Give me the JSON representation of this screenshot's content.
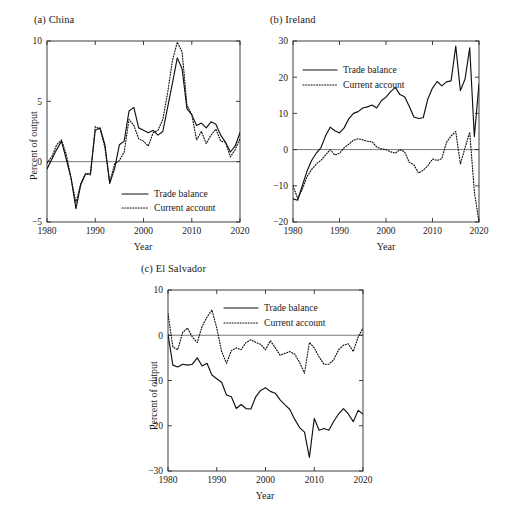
{
  "figure": {
    "panel_count": 3,
    "shared_xlabel": "Year",
    "shared_ylabel": "Percent of output",
    "legend_labels": {
      "solid": "Trade balance",
      "dotted": "Current account"
    },
    "line_color": "#111111"
  },
  "chart_data": [
    {
      "type": "line",
      "title": "(a) China",
      "xlabel": "Year",
      "ylabel": "Percent of output",
      "xlim": [
        1980,
        2020
      ],
      "ylim": [
        -5,
        10
      ],
      "xticks": [
        1980,
        1990,
        2000,
        2010,
        2020
      ],
      "yticks": [
        -5,
        0,
        5,
        10
      ],
      "grid": false,
      "legend_position": "lower-right",
      "x": [
        1980,
        1981,
        1982,
        1983,
        1984,
        1985,
        1986,
        1987,
        1988,
        1989,
        1990,
        1991,
        1992,
        1993,
        1994,
        1995,
        1996,
        1997,
        1998,
        1999,
        2000,
        2001,
        2002,
        2003,
        2004,
        2005,
        2006,
        2007,
        2008,
        2009,
        2010,
        2011,
        2012,
        2013,
        2014,
        2015,
        2016,
        2017,
        2018,
        2019,
        2020
      ],
      "series": [
        {
          "name": "Trade balance",
          "style": "solid",
          "values": [
            -0.6,
            0.2,
            1.0,
            1.7,
            0.2,
            -1.4,
            -3.9,
            -1.9,
            -1.0,
            -1.0,
            2.6,
            2.8,
            1.4,
            -1.8,
            -0.6,
            1.4,
            1.7,
            4.2,
            4.5,
            2.8,
            2.6,
            2.4,
            2.6,
            2.2,
            2.5,
            4.5,
            6.5,
            8.6,
            7.7,
            4.4,
            3.9,
            3.0,
            3.2,
            2.8,
            3.3,
            3.1,
            2.2,
            1.6,
            0.8,
            1.3,
            2.4
          ]
        },
        {
          "name": "Current account",
          "style": "dotted",
          "values": [
            -0.1,
            0.4,
            1.4,
            1.8,
            0.6,
            -1.4,
            -3.4,
            -1.8,
            -1.0,
            -1.1,
            2.9,
            2.7,
            1.2,
            -1.7,
            -0.2,
            0.1,
            0.8,
            3.5,
            3.0,
            1.9,
            1.7,
            1.3,
            2.4,
            2.6,
            3.5,
            5.7,
            8.4,
            9.9,
            9.1,
            4.7,
            3.9,
            1.8,
            2.5,
            1.5,
            2.2,
            2.7,
            1.7,
            1.6,
            0.4,
            1.0,
            1.9
          ]
        }
      ]
    },
    {
      "type": "line",
      "title": "(b) Ireland",
      "xlabel": "Year",
      "ylabel": "",
      "xlim": [
        1980,
        2020
      ],
      "ylim": [
        -20,
        30
      ],
      "xticks": [
        1980,
        1990,
        2000,
        2010,
        2020
      ],
      "yticks": [
        -20,
        -10,
        0,
        10,
        20,
        30
      ],
      "grid": false,
      "legend_position": "upper-left",
      "x": [
        1980,
        1981,
        1982,
        1983,
        1984,
        1985,
        1986,
        1987,
        1988,
        1989,
        1990,
        1991,
        1992,
        1993,
        1994,
        1995,
        1996,
        1997,
        1998,
        1999,
        2000,
        2001,
        2002,
        2003,
        2004,
        2005,
        2006,
        2007,
        2008,
        2009,
        2010,
        2011,
        2012,
        2013,
        2014,
        2015,
        2016,
        2017,
        2018,
        2019,
        2020
      ],
      "series": [
        {
          "name": "Trade balance",
          "style": "solid",
          "values": [
            -13.6,
            -14.0,
            -10.0,
            -6.0,
            -3.0,
            -1.0,
            0.5,
            3.8,
            6.2,
            5.2,
            4.6,
            6.0,
            8.5,
            10.0,
            10.5,
            11.5,
            11.8,
            12.3,
            11.5,
            13.5,
            14.5,
            16.0,
            17.2,
            15.2,
            14.6,
            12.0,
            9.0,
            8.6,
            8.8,
            14.0,
            17.0,
            18.8,
            17.6,
            18.7,
            19.0,
            28.6,
            16.3,
            19.5,
            28.1,
            3.6,
            18.2
          ]
        },
        {
          "name": "Current account",
          "style": "dotted",
          "values": [
            -10.0,
            -13.5,
            -11.0,
            -7.5,
            -5.5,
            -4.0,
            -3.0,
            -1.5,
            0.0,
            -1.5,
            -1.0,
            0.5,
            1.5,
            2.6,
            3.0,
            2.7,
            2.3,
            2.2,
            0.7,
            0.2,
            0.0,
            -0.6,
            -1.0,
            0.0,
            -0.6,
            -3.5,
            -4.2,
            -6.5,
            -5.7,
            -4.5,
            -2.6,
            -3.0,
            -2.5,
            2.0,
            3.8,
            5.0,
            -4.0,
            0.5,
            4.8,
            -11.6,
            -20.0
          ]
        }
      ]
    },
    {
      "type": "line",
      "title": "(c) El Salvador",
      "xlabel": "Year",
      "ylabel": "Percent of output",
      "xlim": [
        1980,
        2020
      ],
      "ylim": [
        -30,
        10
      ],
      "xticks": [
        1980,
        1990,
        2000,
        2010,
        2020
      ],
      "yticks": [
        -30,
        -20,
        -10,
        0,
        10
      ],
      "grid": false,
      "legend_position": "upper-right",
      "x": [
        1980,
        1981,
        1982,
        1983,
        1984,
        1985,
        1986,
        1987,
        1988,
        1989,
        1990,
        1991,
        1992,
        1993,
        1994,
        1995,
        1996,
        1997,
        1998,
        1999,
        2000,
        2001,
        2002,
        2003,
        2004,
        2005,
        2006,
        2007,
        2008,
        2009,
        2010,
        2011,
        2012,
        2013,
        2014,
        2015,
        2016,
        2017,
        2018,
        2019,
        2020
      ],
      "series": [
        {
          "name": "Trade balance",
          "style": "solid",
          "values": [
            0.2,
            -6.6,
            -7.0,
            -6.4,
            -6.6,
            -6.4,
            -5.0,
            -6.8,
            -6.2,
            -8.8,
            -9.6,
            -10.4,
            -13.2,
            -13.6,
            -16.2,
            -15.3,
            -16.2,
            -16.3,
            -13.6,
            -12.2,
            -11.6,
            -12.4,
            -12.8,
            -14.3,
            -15.4,
            -16.4,
            -18.6,
            -20.4,
            -21.4,
            -27.0,
            -18.4,
            -21.0,
            -20.6,
            -21.0,
            -19.0,
            -17.4,
            -16.2,
            -17.4,
            -19.1,
            -16.6,
            -17.4
          ]
        },
        {
          "name": "Current account",
          "style": "dotted",
          "values": [
            4.8,
            -2.6,
            -3.2,
            0.6,
            1.6,
            -0.4,
            -1.6,
            2.0,
            4.0,
            5.6,
            1.6,
            -3.6,
            -6.2,
            -3.4,
            -2.8,
            -3.2,
            -1.6,
            -1.0,
            -1.6,
            -2.0,
            -3.2,
            -1.2,
            -2.8,
            -4.4,
            -4.0,
            -3.6,
            -4.2,
            -6.0,
            -8.4,
            -1.6,
            -2.8,
            -4.8,
            -6.4,
            -6.4,
            -5.4,
            -3.2,
            -2.2,
            -1.9,
            -3.6,
            -0.4,
            1.6
          ]
        }
      ]
    }
  ]
}
